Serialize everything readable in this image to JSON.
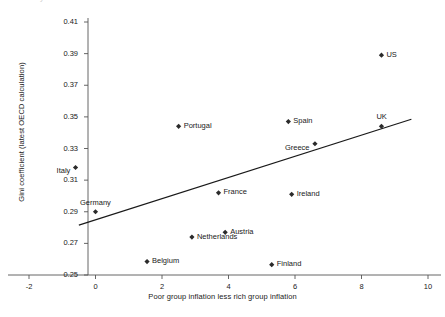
{
  "chart_data": {
    "type": "scatter",
    "title": "",
    "xlabel": "Poor group inflation less rich group inflation",
    "ylabel": "Gini coefficient (latest OECD calculation)",
    "xlim": [
      -2,
      10
    ],
    "ylim": [
      0.25,
      0.41
    ],
    "xticks": [
      "-2",
      "0",
      "2",
      "4",
      "6",
      "8",
      "10"
    ],
    "yticks": [
      "0.25",
      "0.27",
      "0.29",
      "0.31",
      "0.33",
      "0.35",
      "0.37",
      "0.39",
      "0.41"
    ],
    "grid": false,
    "legend": "none",
    "marker_color": "#2b2b2b",
    "line_color": "#1a1a1a",
    "points": [
      {
        "label": "US",
        "x": 8.6,
        "y": 0.389,
        "label_pos": "right"
      },
      {
        "label": "UK",
        "x": 8.6,
        "y": 0.344,
        "label_pos": "above"
      },
      {
        "label": "Spain",
        "x": 5.8,
        "y": 0.347,
        "label_pos": "right"
      },
      {
        "label": "Greece",
        "x": 6.6,
        "y": 0.333,
        "label_pos": "left"
      },
      {
        "label": "Portugal",
        "x": 2.5,
        "y": 0.344,
        "label_pos": "right"
      },
      {
        "label": "Italy",
        "x": -0.6,
        "y": 0.318,
        "label_pos": "left"
      },
      {
        "label": "Germany",
        "x": 0.0,
        "y": 0.29,
        "label_pos": "above"
      },
      {
        "label": "France",
        "x": 3.7,
        "y": 0.302,
        "label_pos": "right"
      },
      {
        "label": "Ireland",
        "x": 5.9,
        "y": 0.301,
        "label_pos": "right"
      },
      {
        "label": "Austria",
        "x": 3.9,
        "y": 0.277,
        "label_pos": "right"
      },
      {
        "label": "Netherlands",
        "x": 2.9,
        "y": 0.274,
        "label_pos": "right"
      },
      {
        "label": "Belgium",
        "x": 1.55,
        "y": 0.2585,
        "label_pos": "right"
      },
      {
        "label": "Finland",
        "x": 5.3,
        "y": 0.2565,
        "label_pos": "right"
      }
    ],
    "trendline": {
      "x1": -0.5,
      "y1": 0.2815,
      "x2": 9.5,
      "y2": 0.3485
    }
  },
  "top_cropped_text": {
    "fragment": "y"
  }
}
